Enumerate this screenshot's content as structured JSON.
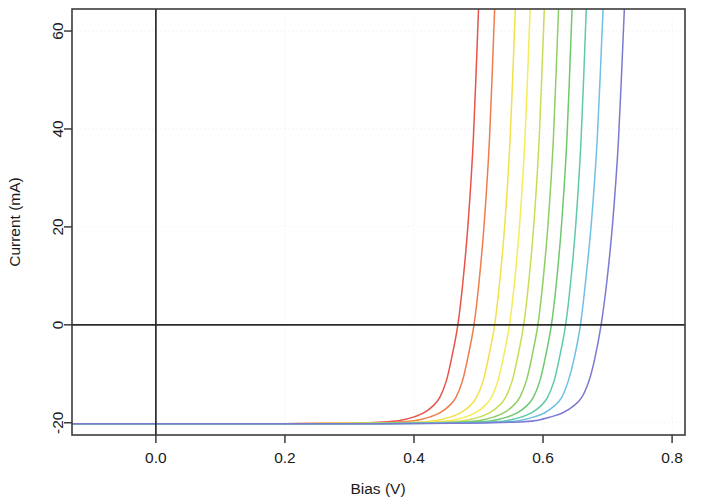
{
  "chart_data": {
    "type": "line",
    "title": "",
    "subtitle": "",
    "xlabel": "Bias (V)",
    "ylabel": "Current (mA)",
    "xlim": [
      -0.13,
      0.82
    ],
    "ylim": [
      -22.5,
      64.5
    ],
    "xticks": [
      0.0,
      0.2,
      0.4,
      0.6,
      0.8
    ],
    "xticklabels": [
      "0.0",
      "0.2",
      "0.4",
      "0.6",
      "0.8"
    ],
    "yticks": [
      -20,
      0,
      20,
      40,
      60
    ],
    "yticklabels": [
      "-20",
      "0",
      "20",
      "40",
      "60"
    ],
    "grid": true,
    "grid_style": "dotted",
    "legend": "none",
    "reverse_saturation_current_mA": -20.2,
    "series": [
      {
        "name": "curve-1",
        "color": "#e8534a",
        "zero_crossing_v": 0.468,
        "knee_v": 0.4,
        "x": [
          -0.13,
          0.0,
          0.1,
          0.2,
          0.28,
          0.33,
          0.36,
          0.38,
          0.4,
          0.415,
          0.43,
          0.44,
          0.45,
          0.458,
          0.468,
          0.476,
          0.484,
          0.492,
          0.5
        ],
        "y": [
          -20.2,
          -20.2,
          -20.2,
          -20.2,
          -20.1,
          -20.0,
          -19.8,
          -19.5,
          -18.8,
          -18.0,
          -16.5,
          -14.8,
          -11.5,
          -7.0,
          0.0,
          9.0,
          21.0,
          38.0,
          64.5
        ]
      },
      {
        "name": "curve-2",
        "color": "#ef7c4c",
        "zero_crossing_v": 0.493,
        "knee_v": 0.425,
        "x": [
          -0.13,
          0.0,
          0.1,
          0.2,
          0.3,
          0.35,
          0.385,
          0.405,
          0.425,
          0.44,
          0.455,
          0.465,
          0.475,
          0.483,
          0.493,
          0.501,
          0.509,
          0.517,
          0.525
        ],
        "y": [
          -20.2,
          -20.2,
          -20.2,
          -20.2,
          -20.1,
          -20.0,
          -19.8,
          -19.5,
          -18.8,
          -18.0,
          -16.5,
          -14.8,
          -11.5,
          -7.0,
          0.0,
          9.0,
          21.0,
          38.0,
          64.5
        ]
      },
      {
        "name": "curve-3",
        "color": "#f2e04a",
        "zero_crossing_v": 0.525,
        "knee_v": 0.457,
        "x": [
          -0.13,
          0.0,
          0.1,
          0.2,
          0.32,
          0.38,
          0.417,
          0.437,
          0.457,
          0.472,
          0.487,
          0.497,
          0.507,
          0.515,
          0.525,
          0.533,
          0.541,
          0.549,
          0.557
        ],
        "y": [
          -20.2,
          -20.2,
          -20.2,
          -20.2,
          -20.1,
          -20.0,
          -19.8,
          -19.5,
          -18.8,
          -18.0,
          -16.5,
          -14.8,
          -11.5,
          -7.0,
          0.0,
          9.0,
          21.0,
          38.0,
          64.5
        ]
      },
      {
        "name": "curve-4",
        "color": "#f4ec58",
        "zero_crossing_v": 0.548,
        "knee_v": 0.48,
        "x": [
          -0.13,
          0.0,
          0.1,
          0.22,
          0.34,
          0.4,
          0.44,
          0.46,
          0.48,
          0.495,
          0.51,
          0.52,
          0.53,
          0.538,
          0.548,
          0.556,
          0.564,
          0.572,
          0.58
        ],
        "y": [
          -20.2,
          -20.2,
          -20.2,
          -20.2,
          -20.1,
          -20.0,
          -19.8,
          -19.5,
          -18.8,
          -18.0,
          -16.5,
          -14.8,
          -11.5,
          -7.0,
          0.0,
          9.0,
          21.0,
          38.0,
          64.5
        ]
      },
      {
        "name": "curve-5",
        "color": "#c8dd55",
        "zero_crossing_v": 0.57,
        "knee_v": 0.502,
        "x": [
          -0.13,
          0.0,
          0.12,
          0.24,
          0.36,
          0.42,
          0.462,
          0.482,
          0.502,
          0.517,
          0.532,
          0.542,
          0.552,
          0.56,
          0.57,
          0.578,
          0.586,
          0.594,
          0.602
        ],
        "y": [
          -20.2,
          -20.2,
          -20.2,
          -20.2,
          -20.1,
          -20.0,
          -19.8,
          -19.5,
          -18.8,
          -18.0,
          -16.5,
          -14.8,
          -11.5,
          -7.0,
          0.0,
          9.0,
          21.0,
          38.0,
          64.5
        ]
      },
      {
        "name": "curve-6",
        "color": "#8fce63",
        "zero_crossing_v": 0.592,
        "knee_v": 0.524,
        "x": [
          -0.13,
          0.0,
          0.12,
          0.26,
          0.38,
          0.44,
          0.484,
          0.504,
          0.524,
          0.539,
          0.554,
          0.564,
          0.574,
          0.582,
          0.592,
          0.6,
          0.608,
          0.616,
          0.624
        ],
        "y": [
          -20.2,
          -20.2,
          -20.2,
          -20.2,
          -20.1,
          -20.0,
          -19.8,
          -19.5,
          -18.8,
          -18.0,
          -16.5,
          -14.8,
          -11.5,
          -7.0,
          0.0,
          9.0,
          21.0,
          38.0,
          64.5
        ]
      },
      {
        "name": "curve-7",
        "color": "#6fc86f",
        "zero_crossing_v": 0.613,
        "knee_v": 0.545,
        "x": [
          -0.13,
          0.0,
          0.14,
          0.28,
          0.4,
          0.46,
          0.505,
          0.525,
          0.545,
          0.56,
          0.575,
          0.585,
          0.595,
          0.603,
          0.613,
          0.621,
          0.629,
          0.637,
          0.645
        ],
        "y": [
          -20.2,
          -20.2,
          -20.2,
          -20.2,
          -20.1,
          -20.0,
          -19.8,
          -19.5,
          -18.8,
          -18.0,
          -16.5,
          -14.8,
          -11.5,
          -7.0,
          0.0,
          9.0,
          21.0,
          38.0,
          64.5
        ]
      },
      {
        "name": "curve-8",
        "color": "#5fc9a8",
        "zero_crossing_v": 0.635,
        "knee_v": 0.567,
        "x": [
          -0.13,
          0.0,
          0.16,
          0.3,
          0.42,
          0.48,
          0.527,
          0.547,
          0.567,
          0.582,
          0.597,
          0.607,
          0.617,
          0.625,
          0.635,
          0.643,
          0.651,
          0.659,
          0.667
        ],
        "y": [
          -20.2,
          -20.2,
          -20.2,
          -20.2,
          -20.1,
          -20.0,
          -19.8,
          -19.5,
          -18.8,
          -18.0,
          -16.5,
          -14.8,
          -11.5,
          -7.0,
          0.0,
          9.0,
          21.0,
          38.0,
          64.5
        ]
      },
      {
        "name": "curve-9",
        "color": "#6fc0e4",
        "zero_crossing_v": 0.658,
        "knee_v": 0.586,
        "x": [
          -0.13,
          0.0,
          0.18,
          0.32,
          0.44,
          0.5,
          0.546,
          0.566,
          0.586,
          0.602,
          0.618,
          0.629,
          0.639,
          0.648,
          0.658,
          0.666,
          0.675,
          0.684,
          0.693
        ],
        "y": [
          -20.2,
          -20.2,
          -20.2,
          -20.2,
          -20.1,
          -20.0,
          -19.8,
          -19.5,
          -18.8,
          -18.0,
          -16.5,
          -14.8,
          -11.5,
          -7.0,
          0.0,
          9.0,
          21.0,
          38.0,
          64.5
        ]
      },
      {
        "name": "curve-10",
        "color": "#7b7ad2",
        "zero_crossing_v": 0.69,
        "knee_v": 0.612,
        "x": [
          -0.13,
          0.0,
          0.2,
          0.34,
          0.46,
          0.52,
          0.57,
          0.592,
          0.612,
          0.63,
          0.648,
          0.66,
          0.671,
          0.68,
          0.69,
          0.699,
          0.708,
          0.717,
          0.726
        ],
        "y": [
          -20.2,
          -20.2,
          -20.2,
          -20.2,
          -20.1,
          -20.0,
          -19.8,
          -19.5,
          -18.8,
          -18.0,
          -16.5,
          -14.8,
          -11.5,
          -7.0,
          0.0,
          9.0,
          21.0,
          38.0,
          64.5
        ]
      }
    ]
  }
}
